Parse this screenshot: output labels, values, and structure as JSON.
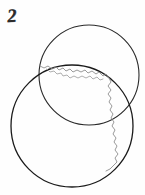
{
  "figure": {
    "label": "2",
    "background_color": "#fefefe",
    "ink_color": "#1a1a1a",
    "faint_ink_color": "#8c8c8c",
    "width": 145,
    "height": 195,
    "shapes": {
      "upper_circle": {
        "name": "upper-circle",
        "center_x": 89,
        "center_y": 75,
        "radius": 50,
        "stroke_color": "#2a2a2a",
        "stroke_width": 1.1,
        "fill": "none"
      },
      "lower_circle": {
        "name": "lower-circle",
        "center_x": 72,
        "center_y": 126,
        "radius": 61,
        "stroke_color": "#1a1a1a",
        "stroke_width": 1.3,
        "fill": "none"
      },
      "ragged_contour": {
        "name": "ragged-contour",
        "stroke_color": "#8f8f8f",
        "stroke_width": 0.9,
        "fill": "none",
        "path": "M 40 66 L 44 68 L 48 66 L 52 69 L 56 67 L 59 70 L 63 68 L 66 71 L 70 69 L 73 72 L 77 70 L 81 72 L 85 70 L 88 73 L 92 71 L 96 74 L 99 72 L 103 76 L 106 74 L 109 78 L 111 82 L 108 86 L 111 90 L 108 94 L 111 98 L 109 102 L 112 106 L 110 110 L 113 114 L 111 118 L 114 122 L 112 126 L 115 130 L 113 134 L 116 138 L 114 142 L 117 146 L 115 150 L 118 154 L 115 158 L 117 162 L 113 166 L 110 169 L 106 171"
      },
      "ragged_inner_detail": {
        "name": "ragged-inner-detail",
        "stroke_color": "#9a9a9a",
        "stroke_width": 0.8,
        "fill": "none",
        "path": "M 47 69 L 50 72 L 54 71 L 57 74 L 61 73 L 63 76 L 67 75 L 70 78 L 74 76 L 78 78 L 82 76 L 86 78 L 90 76 L 93 79 L 97 77 L 100 80 L 103 79"
      }
    }
  }
}
